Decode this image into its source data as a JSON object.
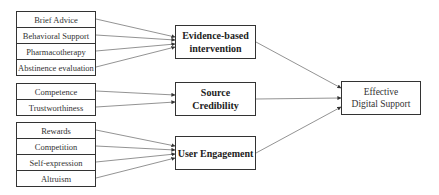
{
  "diagram": {
    "groups": [
      {
        "construct": "Evidence-based intervention",
        "construct_lines": [
          "Evidence-based",
          "intervention"
        ],
        "factors": [
          "Brief Advice",
          "Behavioral Support",
          "Pharmacotherapy",
          "Abstinence evaluation"
        ]
      },
      {
        "construct": "Source Credibility",
        "construct_lines": [
          "Source",
          "Credibility"
        ],
        "factors": [
          "Competence",
          "Trustworthiness"
        ]
      },
      {
        "construct": "User Engagement",
        "construct_lines": [
          "User Engagement"
        ],
        "factors": [
          "Rewards",
          "Competition",
          "Self-expression",
          "Altruism"
        ]
      }
    ],
    "outcome": {
      "label": "Effective Digital Support",
      "lines": [
        "Effective",
        "Digital Support"
      ]
    },
    "colors": {
      "border": "#333333",
      "arrow": "#777777",
      "background": "#ffffff"
    }
  }
}
